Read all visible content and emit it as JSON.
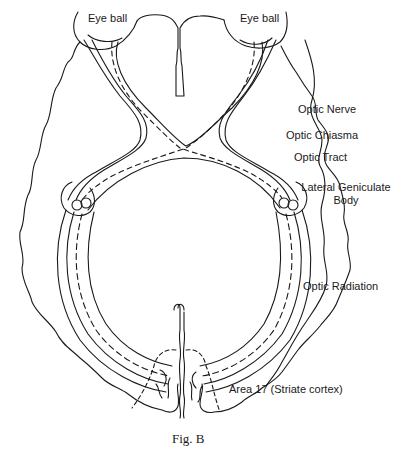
{
  "figure": {
    "caption": "Fig. B"
  },
  "labels": {
    "eyeball_left": "Eye ball",
    "eyeball_right": "Eye ball",
    "optic_nerve": "Optic Nerve",
    "optic_chiasma": "Optic Chiasma",
    "optic_tract": "Optic Tract",
    "lgn_line1": "Lateral Geniculate",
    "lgn_line2": "Body",
    "optic_radiation": "Optic Radiation",
    "area17": "Area 17 (Striate cortex)"
  },
  "colors": {
    "line": "#1a1a1a",
    "background": "#ffffff"
  }
}
